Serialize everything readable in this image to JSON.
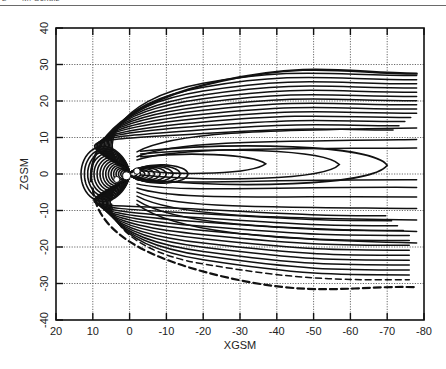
{
  "running_head": {
    "page": "2",
    "author": "M. Schulz"
  },
  "chart_data": {
    "type": "line",
    "title": "",
    "xlabel": "XGSM",
    "ylabel": "ZGSM",
    "xlim": [
      20,
      -80
    ],
    "ylim": [
      -40,
      40
    ],
    "xticks": [
      "20",
      "10",
      "0",
      "-10",
      "-20",
      "-30",
      "-40",
      "-50",
      "-60",
      "-70",
      "-80"
    ],
    "yticks": [
      "40",
      "30",
      "20",
      "10",
      "0",
      "-10",
      "-20",
      "-30",
      "-40"
    ],
    "grid": "dotted",
    "legend": null,
    "closed_tail_loops_x_end": [
      -37,
      -57,
      -70
    ],
    "magnetopause_subsolar_x": 10.5,
    "tail_lobe_z_extent": [
      27,
      -30
    ]
  },
  "colors": {
    "line": "#111111",
    "grid": "#444444",
    "frame": "#111111"
  }
}
